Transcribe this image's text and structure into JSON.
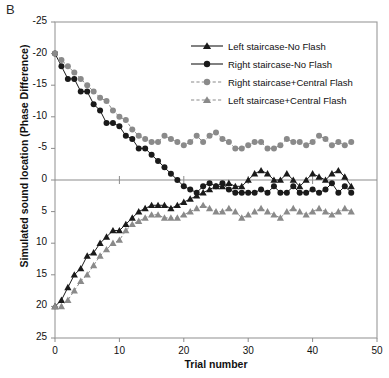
{
  "panel_label": "B",
  "axes": {
    "xlabel": "Trial number",
    "ylabel": "Simulated sound location (Phase Difference)",
    "xticks": [
      "0",
      "10",
      "20",
      "30",
      "40",
      "50"
    ],
    "yticks": [
      "25",
      "20",
      "15",
      "10",
      "5",
      "0",
      "-5",
      "-10",
      "-15",
      "-20",
      "-25"
    ]
  },
  "legend": {
    "items": [
      {
        "label": "Left staircase-No Flash",
        "marker": "triangle",
        "color": "#1a1a1a",
        "dash": "solid"
      },
      {
        "label": "Right staircase-No Flash",
        "marker": "circle",
        "color": "#1a1a1a",
        "dash": "solid"
      },
      {
        "label": "Right staircase+Central Flash",
        "marker": "circle",
        "color": "#8a8a8a",
        "dash": "dashed"
      },
      {
        "label": "Left staircase+Central Flash",
        "marker": "triangle",
        "color": "#8a8a8a",
        "dash": "dashed"
      }
    ]
  },
  "colors": {
    "black_series": "#1a1a1a",
    "gray_series": "#8a8a8a",
    "axis": "#8c8c8c",
    "frame": "#9a9a9a",
    "background": "#ffffff"
  },
  "chart_data": {
    "type": "line",
    "title": "B",
    "xlabel": "Trial number",
    "ylabel": "Simulated sound location (Phase Difference)",
    "xlim": [
      0,
      50
    ],
    "ylim": [
      -25,
      25
    ],
    "xticks": [
      0,
      10,
      20,
      30,
      40,
      50
    ],
    "yticks": [
      -25,
      -20,
      -15,
      -10,
      -5,
      0,
      5,
      10,
      15,
      20,
      25
    ],
    "grid": false,
    "legend_position": "upper right inside",
    "zero_line": true,
    "series": [
      {
        "name": "Right staircase-No Flash",
        "marker": "circle",
        "color": "#1a1a1a",
        "dash": "solid",
        "x": [
          0,
          1,
          2,
          3,
          4,
          5,
          6,
          7,
          8,
          9,
          10,
          11,
          12,
          13,
          14,
          15,
          16,
          17,
          18,
          19,
          20,
          21,
          22,
          23,
          24,
          25,
          26,
          27,
          28,
          29,
          30,
          31,
          32,
          33,
          34,
          35,
          36,
          37,
          38,
          39,
          40,
          41,
          42,
          43,
          44,
          45,
          46
        ],
        "y": [
          20,
          18,
          16,
          16,
          14,
          14,
          12,
          11,
          9,
          9,
          8.5,
          7,
          6.5,
          5,
          5,
          4,
          3,
          2,
          1,
          0,
          -1,
          -1.5,
          -2,
          -1,
          -0.5,
          -1,
          -0.5,
          -1.5,
          -2,
          -2,
          -2,
          -2,
          -1.5,
          -2,
          -1,
          -2,
          -2,
          -1,
          -2,
          -2,
          -1.5,
          -2,
          -1.5,
          -0.5,
          -2,
          -1,
          -2
        ]
      },
      {
        "name": "Right staircase+Central Flash",
        "marker": "circle",
        "color": "#8a8a8a",
        "dash": "dashed",
        "x": [
          0,
          1,
          2,
          3,
          4,
          5,
          6,
          7,
          8,
          9,
          10,
          11,
          12,
          13,
          14,
          15,
          16,
          17,
          18,
          19,
          20,
          21,
          22,
          23,
          24,
          25,
          26,
          27,
          28,
          29,
          30,
          31,
          32,
          33,
          34,
          35,
          36,
          37,
          38,
          39,
          40,
          41,
          42,
          43,
          44,
          45,
          46
        ],
        "y": [
          20,
          19,
          18,
          17,
          16,
          15,
          14,
          13,
          12.5,
          11,
          10,
          9.5,
          8,
          7,
          6.5,
          6,
          6,
          7,
          6.5,
          6,
          5.5,
          6,
          7,
          6,
          7,
          7.5,
          6.5,
          6,
          5,
          5,
          5.5,
          6,
          6,
          5,
          5,
          5.5,
          6.5,
          6,
          6,
          5.5,
          6,
          7,
          6.5,
          5.5,
          6,
          5.5,
          6
        ]
      },
      {
        "name": "Left staircase-No Flash",
        "marker": "triangle",
        "color": "#1a1a1a",
        "dash": "solid",
        "x": [
          0,
          1,
          2,
          3,
          4,
          5,
          6,
          7,
          8,
          9,
          10,
          11,
          12,
          13,
          14,
          15,
          16,
          17,
          18,
          19,
          20,
          21,
          22,
          23,
          24,
          25,
          26,
          27,
          28,
          29,
          30,
          31,
          32,
          33,
          34,
          35,
          36,
          37,
          38,
          39,
          40,
          41,
          42,
          43,
          44,
          45,
          46
        ],
        "y": [
          -20,
          -19,
          -17,
          -15,
          -14,
          -12,
          -11.5,
          -10,
          -9,
          -8,
          -8,
          -7,
          -6,
          -5,
          -4.5,
          -4,
          -4,
          -4,
          -4.5,
          -4,
          -3.5,
          -3,
          -2.5,
          -2,
          -1.5,
          -1,
          -1,
          -0.5,
          -1,
          -1,
          0,
          1,
          1.5,
          1,
          0,
          0,
          1,
          0,
          -1,
          0,
          1,
          0.5,
          0,
          1,
          1.5,
          0.5,
          -1
        ]
      },
      {
        "name": "Left staircase+Central Flash",
        "marker": "triangle",
        "color": "#8a8a8a",
        "dash": "dashed",
        "x": [
          0,
          1,
          2,
          3,
          4,
          5,
          6,
          7,
          8,
          9,
          10,
          11,
          12,
          13,
          14,
          15,
          16,
          17,
          18,
          19,
          20,
          21,
          22,
          23,
          24,
          25,
          26,
          27,
          28,
          29,
          30,
          31,
          32,
          33,
          34,
          35,
          36,
          37,
          38,
          39,
          40,
          41,
          42,
          43,
          44,
          45,
          46
        ],
        "y": [
          -20,
          -20,
          -19,
          -17.5,
          -16,
          -15,
          -13.5,
          -12,
          -11,
          -10,
          -9.5,
          -8,
          -7,
          -6.5,
          -6,
          -5.5,
          -5.5,
          -6,
          -6,
          -6,
          -5.5,
          -5,
          -4.5,
          -4,
          -4.5,
          -5,
          -5,
          -4.5,
          -5,
          -6,
          -5.5,
          -5,
          -4.5,
          -5,
          -5.5,
          -6,
          -5,
          -4.5,
          -5,
          -5.5,
          -5,
          -4.5,
          -5,
          -5.5,
          -5,
          -4.5,
          -5
        ]
      }
    ]
  }
}
